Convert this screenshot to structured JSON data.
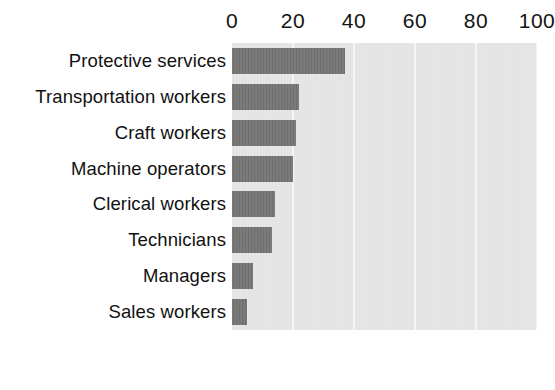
{
  "chart_data": {
    "type": "bar",
    "orientation": "horizontal",
    "title": "",
    "subtitle": "",
    "xlabel": "",
    "ylabel": "",
    "categories": [
      "Protective services",
      "Transportation workers",
      "Craft workers",
      "Machine operators",
      "Clerical workers",
      "Technicians",
      "Managers",
      "Sales workers"
    ],
    "values": [
      37,
      22,
      21,
      20,
      14,
      13,
      7,
      5
    ],
    "xlim": [
      0,
      100
    ],
    "xticks": [
      0,
      20,
      40,
      60,
      80,
      100
    ],
    "xtick_labels": [
      "0",
      "20",
      "40",
      "60",
      "80",
      "100"
    ],
    "axis_position": "top",
    "grid": true,
    "grid_axis": "x",
    "legend": false,
    "bar_color": "#6e6e6e",
    "plot_background": "#e3e3e3",
    "gridline_color": "#f4f4f4",
    "page_background": "#ffffff"
  }
}
